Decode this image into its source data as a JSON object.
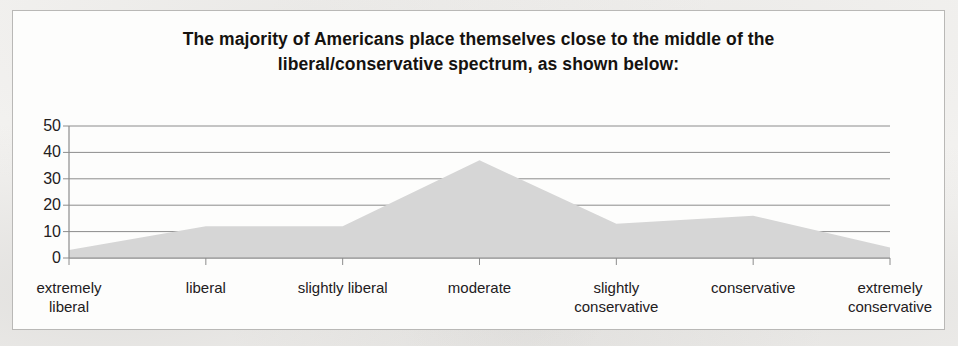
{
  "figure": {
    "title_line1": "The majority of Americans place themselves close to the middle of the",
    "title_line2": "liberal/conservative spectrum, as shown below:"
  },
  "chart_data": {
    "type": "area",
    "title": "The majority of Americans place themselves close to the middle of the liberal/conservative spectrum, as shown below:",
    "categories": [
      "extremely liberal",
      "liberal",
      "slightly liberal",
      "moderate",
      "slightly conservative",
      "conservative",
      "extremely conservative"
    ],
    "category_lines": [
      [
        "extremely",
        "liberal"
      ],
      [
        "liberal"
      ],
      [
        "slightly liberal"
      ],
      [
        "moderate"
      ],
      [
        "slightly",
        "conservative"
      ],
      [
        "conservative"
      ],
      [
        "extremely",
        "conservative"
      ]
    ],
    "values": [
      3,
      12,
      12,
      37,
      13,
      16,
      4
    ],
    "xlabel": "",
    "ylabel": "",
    "ylim": [
      0,
      50
    ],
    "yticks": [
      50,
      40,
      30,
      20,
      10,
      0
    ],
    "ytick_labels": [
      "50",
      "40",
      "30",
      "20",
      "10",
      "0"
    ],
    "grid": true,
    "legend": false,
    "series_name": "percent of respondents",
    "area_fill_color": "#d6d6d6",
    "gridline_color": "#8c8c8c",
    "axis_color": "#8c8c8c",
    "text_color": "#23201d",
    "frame_border_color": "#b9b8b6",
    "page_background": "#f4f3f1",
    "panel_background": "#fdfdfc"
  }
}
